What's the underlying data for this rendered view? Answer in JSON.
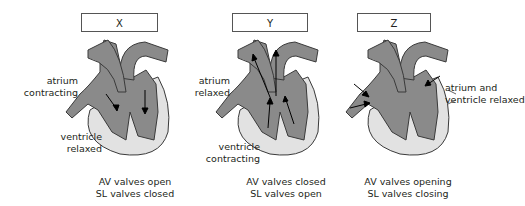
{
  "diagram": {
    "panels": [
      {
        "id": "X",
        "label": "X",
        "upper_annotation": [
          "atrium",
          "contracting"
        ],
        "lower_annotation": [
          "ventricle",
          "relaxed"
        ],
        "valves": [
          "AV valves open",
          "SL valves closed"
        ]
      },
      {
        "id": "Y",
        "label": "Y",
        "upper_annotation": [
          "atrium",
          "relaxed"
        ],
        "lower_annotation": [
          "ventricle",
          "contracting"
        ],
        "valves": [
          "AV valves closed",
          "SL valves open"
        ]
      },
      {
        "id": "Z",
        "label": "Z",
        "upper_annotation": [
          "atrium and",
          "ventricle relaxed"
        ],
        "lower_annotation": [],
        "valves": [
          "AV valves opening",
          "SL valves closing"
        ]
      }
    ],
    "colors": {
      "heart_fill": "#8a8a8a",
      "heart_stroke": "#3a3a3a",
      "wall_fill": "#e2e2e2",
      "text": "#231f20"
    }
  }
}
